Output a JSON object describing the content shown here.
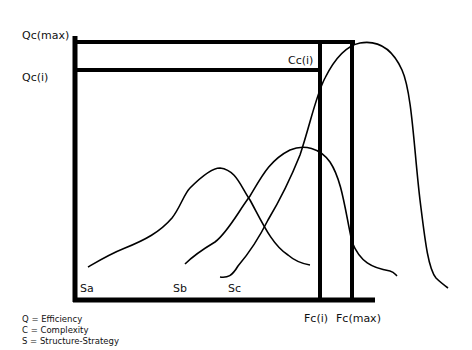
{
  "diagram": {
    "y_labels": {
      "q_max": "Qc(max)",
      "q_i": "Qc(i)"
    },
    "x_labels": {
      "f_i": "Fc(i)",
      "f_max": "Fc(max)"
    },
    "point_label": "Cc(i)",
    "curves": [
      {
        "id": "sa",
        "label": "Sa"
      },
      {
        "id": "sb",
        "label": "Sb"
      },
      {
        "id": "sc",
        "label": "Sc"
      }
    ],
    "legend": [
      "Q = Efficiency",
      "C = Complexity",
      "S = Structure-Strategy"
    ],
    "colors": {
      "ink": "#000000",
      "background": "#ffffff"
    }
  }
}
